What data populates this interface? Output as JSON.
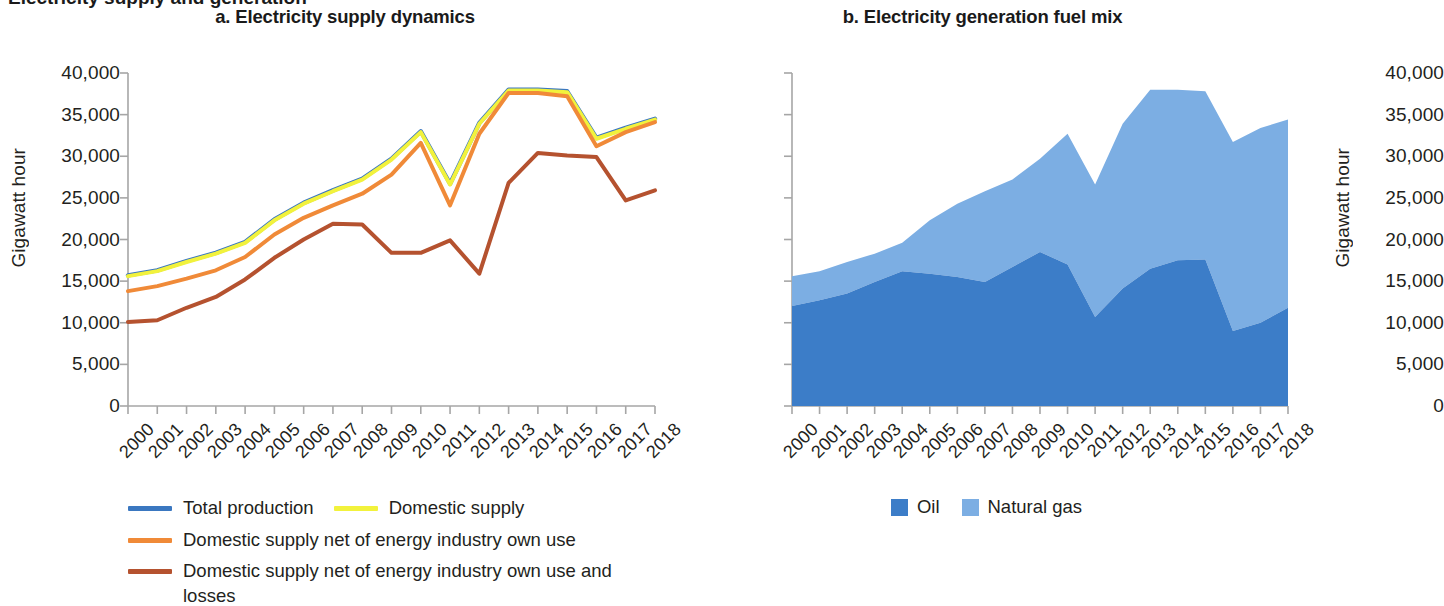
{
  "figure": {
    "supertitle": "Electricity supply and generation"
  },
  "panel_a": {
    "title": "a. Electricity supply dynamics",
    "ylabel": "Gigawatt hour",
    "legend": [
      {
        "label": "Total production",
        "color": "#3A77C0"
      },
      {
        "label": "Domestic supply",
        "color": "#F2F23C"
      },
      {
        "label": "Domestic supply net of energy industry own use",
        "color": "#F08A38"
      },
      {
        "label": "Domestic supply net of energy industry own use and losses",
        "color": "#B5522F"
      }
    ]
  },
  "panel_b": {
    "title": "b. Electricity generation fuel mix",
    "ylabel": "Gigawatt hour",
    "legend": [
      {
        "label": "Oil",
        "color": "#3C7DC8"
      },
      {
        "label": "Natural gas",
        "color": "#7CAEE3"
      }
    ]
  },
  "chart_data": [
    {
      "type": "line",
      "title": "a. Electricity supply dynamics",
      "xlabel": "",
      "ylabel": "Gigawatt hour",
      "ylim": [
        0,
        40000
      ],
      "yticks": [
        "0",
        "5,000",
        "10,000",
        "15,000",
        "20,000",
        "25,000",
        "30,000",
        "35,000",
        "40,000"
      ],
      "ytick_values": [
        0,
        5000,
        10000,
        15000,
        20000,
        25000,
        30000,
        35000,
        40000
      ],
      "grid": false,
      "legend_position": "bottom-left",
      "categories": [
        "2000",
        "2001",
        "2002",
        "2003",
        "2004",
        "2005",
        "2006",
        "2007",
        "2008",
        "2009",
        "2010",
        "2011",
        "2012",
        "2013",
        "2014",
        "2015",
        "2016",
        "2017",
        "2018"
      ],
      "series": [
        {
          "name": "Total production",
          "color": "#3A77C0",
          "values": [
            15700,
            16300,
            17400,
            18400,
            19700,
            22400,
            24400,
            25900,
            27300,
            29700,
            33000,
            26700,
            34000,
            38000,
            38000,
            37800,
            32200,
            33400,
            34500
          ]
        },
        {
          "name": "Domestic supply",
          "color": "#F2F23C",
          "values": [
            15600,
            16200,
            17300,
            18300,
            19600,
            22300,
            24300,
            25800,
            27200,
            29600,
            32900,
            26600,
            33900,
            37900,
            37900,
            37700,
            32100,
            33300,
            34400
          ]
        },
        {
          "name": "Domestic supply net of energy industry own use",
          "color": "#F08A38",
          "values": [
            13800,
            14400,
            15300,
            16300,
            17900,
            20600,
            22600,
            24100,
            25500,
            27800,
            31600,
            24100,
            32700,
            37600,
            37600,
            37200,
            31200,
            32900,
            34100
          ]
        },
        {
          "name": "Domestic supply net of energy industry own use and losses",
          "color": "#B5522F",
          "values": [
            10100,
            10300,
            11800,
            13100,
            15200,
            17800,
            20000,
            21900,
            21800,
            18400,
            18400,
            19900,
            15900,
            26800,
            30400,
            30100,
            29900,
            24700,
            25900,
            27200
          ]
        }
      ]
    },
    {
      "type": "area",
      "title": "b. Electricity generation fuel mix",
      "xlabel": "",
      "ylabel": "Gigawatt hour",
      "ylim": [
        0,
        40000
      ],
      "yticks": [
        "0",
        "5,000",
        "10,000",
        "15,000",
        "20,000",
        "25,000",
        "30,000",
        "35,000",
        "40,000"
      ],
      "ytick_values": [
        0,
        5000,
        10000,
        15000,
        20000,
        25000,
        30000,
        35000,
        40000
      ],
      "stacked": true,
      "grid": false,
      "legend_position": "bottom-center",
      "categories": [
        "2000",
        "2001",
        "2002",
        "2003",
        "2004",
        "2005",
        "2006",
        "2007",
        "2008",
        "2009",
        "2010",
        "2011",
        "2012",
        "2013",
        "2014",
        "2015",
        "2016",
        "2017",
        "2018"
      ],
      "series": [
        {
          "name": "Oil",
          "color": "#3C7DC8",
          "values": [
            12000,
            12700,
            13500,
            14900,
            16200,
            15900,
            15500,
            14900,
            16700,
            18500,
            17000,
            10700,
            14100,
            16500,
            17500,
            17600,
            9000,
            10000,
            11800
          ]
        },
        {
          "name": "Natural gas",
          "color": "#7CAEE3",
          "values": [
            3600,
            3500,
            3800,
            3400,
            3400,
            6400,
            8800,
            10900,
            10500,
            11200,
            15700,
            15900,
            19800,
            21500,
            20500,
            20200,
            22700,
            23400,
            22600
          ]
        }
      ],
      "totals": [
        15600,
        16200,
        17300,
        18300,
        19600,
        22300,
        24300,
        25800,
        27200,
        29700,
        32700,
        26600,
        33900,
        38000,
        38000,
        37800,
        31700,
        33400,
        34400
      ]
    }
  ]
}
